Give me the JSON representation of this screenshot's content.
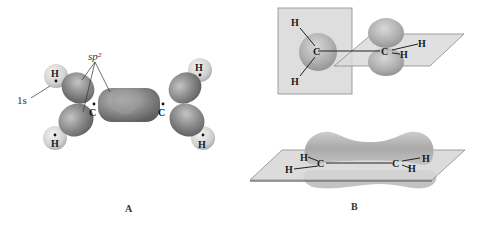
{
  "panels": [
    {
      "id": "A",
      "label": "A",
      "annotations": {
        "sp2": "sp²",
        "s1": "1s"
      },
      "atoms": {
        "c_left": "C",
        "c_right": "C",
        "h1": "H",
        "h2": "H",
        "h3": "H",
        "h4": "H"
      }
    },
    {
      "id": "B",
      "label": "B",
      "top_view": {
        "c1": "C",
        "c2": "C",
        "h1": "H",
        "h2": "H",
        "h3": "H",
        "h4": "H"
      },
      "bottom_view": {
        "c1": "C",
        "c2": "C",
        "h1": "H",
        "h2": "H",
        "h3": "H",
        "h4": "H"
      }
    }
  ],
  "colors": {
    "lobe_dark": "#7a7a7a",
    "lobe_light": "#b8b8b8",
    "h_sphere": "#d9d9d9",
    "plane": "#d4d4d4",
    "plane_edge": "#8a8a8a"
  }
}
